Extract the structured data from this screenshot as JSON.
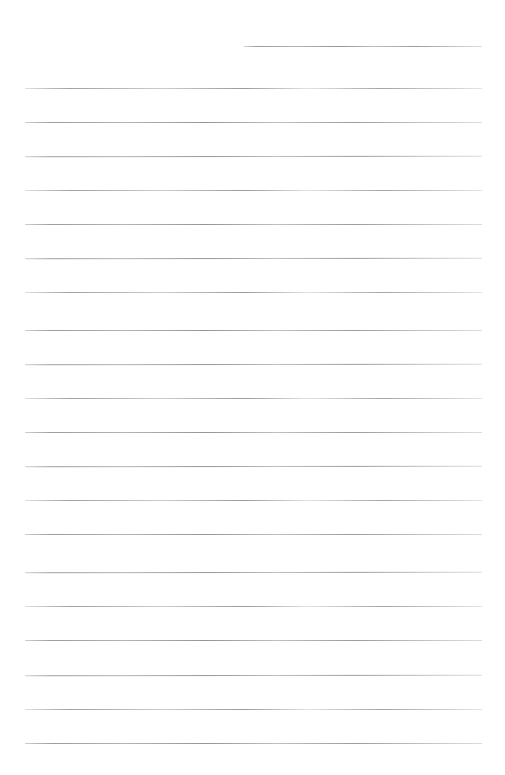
{
  "page": {
    "kind": "blank-ruled-page",
    "width": 505,
    "height": 775,
    "background_color": "#ffffff",
    "rule_color": "#a8a8ac",
    "rule_thickness_px": 1,
    "rule_spacing_px": 34,
    "rule_count": 22,
    "content_text": "",
    "header_text": ""
  },
  "rules": [
    {
      "name": "rule-1-short-header",
      "y": 46,
      "x": 244,
      "width": 238,
      "variant": "skew-a"
    },
    {
      "name": "rule-2",
      "y": 88,
      "x": 25,
      "width": 457,
      "variant": "skew-b"
    },
    {
      "name": "rule-3",
      "y": 122,
      "x": 25,
      "width": 457,
      "variant": "skew-c"
    },
    {
      "name": "rule-4",
      "y": 156,
      "x": 25,
      "width": 457,
      "variant": "skew-a"
    },
    {
      "name": "rule-5",
      "y": 190,
      "x": 25,
      "width": 457,
      "variant": "skew-b"
    },
    {
      "name": "rule-6",
      "y": 224,
      "x": 25,
      "width": 457,
      "variant": "skew-c"
    },
    {
      "name": "rule-7",
      "y": 258,
      "x": 25,
      "width": 457,
      "variant": "skew-a"
    },
    {
      "name": "rule-8",
      "y": 292,
      "x": 25,
      "width": 457,
      "variant": "skew-b"
    },
    {
      "name": "rule-9",
      "y": 330,
      "x": 25,
      "width": 457,
      "variant": "skew-c"
    },
    {
      "name": "rule-10",
      "y": 364,
      "x": 25,
      "width": 457,
      "variant": "skew-a"
    },
    {
      "name": "rule-11",
      "y": 398,
      "x": 25,
      "width": 457,
      "variant": "skew-b"
    },
    {
      "name": "rule-12",
      "y": 432,
      "x": 25,
      "width": 457,
      "variant": "skew-c"
    },
    {
      "name": "rule-13",
      "y": 466,
      "x": 25,
      "width": 457,
      "variant": "skew-a"
    },
    {
      "name": "rule-14",
      "y": 500,
      "x": 25,
      "width": 457,
      "variant": "skew-b"
    },
    {
      "name": "rule-15",
      "y": 534,
      "x": 25,
      "width": 457,
      "variant": "skew-c"
    },
    {
      "name": "rule-16",
      "y": 572,
      "x": 25,
      "width": 457,
      "variant": "skew-a"
    },
    {
      "name": "rule-17",
      "y": 606,
      "x": 25,
      "width": 457,
      "variant": "skew-b"
    },
    {
      "name": "rule-18",
      "y": 640,
      "x": 25,
      "width": 457,
      "variant": "skew-c"
    },
    {
      "name": "rule-19",
      "y": 675,
      "x": 25,
      "width": 457,
      "variant": "skew-a"
    },
    {
      "name": "rule-20",
      "y": 709,
      "x": 25,
      "width": 457,
      "variant": "skew-b"
    },
    {
      "name": "rule-21",
      "y": 743,
      "x": 25,
      "width": 457,
      "variant": "skew-c"
    }
  ]
}
